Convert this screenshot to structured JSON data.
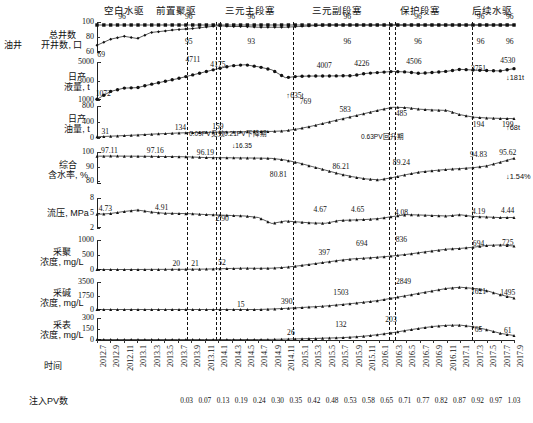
{
  "phases": [
    {
      "label": "空白水驱",
      "x": 124
    },
    {
      "label": "前置聚驱",
      "x": 176
    },
    {
      "label": "三元主段塞",
      "x": 250
    },
    {
      "label": "三元副段塞",
      "x": 337
    },
    {
      "label": "保护段塞",
      "x": 420
    },
    {
      "label": "后续水驱",
      "x": 492
    }
  ],
  "group_label": "油井",
  "rows": [
    {
      "label": "总井数\n开井数, 口",
      "unit": "口"
    },
    {
      "label": "日产\n液量, t"
    },
    {
      "label": "日产\n油量, t"
    },
    {
      "label": "综合\n含水率, %"
    },
    {
      "label": "流压, MPa"
    },
    {
      "label": "采聚\n浓度, mg/L"
    },
    {
      "label": "采碱\n浓度, mg/L"
    },
    {
      "label": "采表\n浓度, mg/L"
    }
  ],
  "axis": {
    "time_caption": "时间",
    "pv_caption": "注入PV数",
    "x_labels": [
      "2012.7",
      "2012.9",
      "2012.11",
      "2013.1",
      "2013.3",
      "2013.5",
      "2013.7",
      "2013.9",
      "2013.11",
      "2014.1",
      "2014.3",
      "2014.5",
      "2014.7",
      "2014.9",
      "2014.11",
      "2015.1",
      "2015.3",
      "2015.5",
      "2015.7",
      "2015.9",
      "2015.11",
      "2016.1",
      "2016.3",
      "2016.5",
      "2016.7",
      "2016.9",
      "2016.11",
      "2017.1",
      "2017.3",
      "2017.5",
      "2017.7",
      "2017.9"
    ],
    "pv_values": [
      "0.03",
      "0.07",
      "0.13",
      "0.19",
      "0.24",
      "0.30",
      "0.35",
      "0.42",
      "0.48",
      "0.53",
      "0.58",
      "0.65",
      "0.71",
      "0.77",
      "0.82",
      "0.87",
      "0.92",
      "0.97",
      "1.03"
    ]
  },
  "annotations": {
    "effect_onset": "0.09PV见效",
    "decline_period": "0.21PV下降期",
    "decline_delta": "↓16.35",
    "recovery_period": "0.63PV回升期",
    "right_liquid": "↓181t",
    "right_oil": "↑68t",
    "right_water": "↓1.54%"
  },
  "chart_data": {
    "type": "line",
    "title": "",
    "xlabel": "时间",
    "ylabel": "",
    "grid": false,
    "legend": "none",
    "x": [
      "2012.7",
      "2012.9",
      "2012.11",
      "2013.1",
      "2013.3",
      "2013.5",
      "2013.7",
      "2013.9",
      "2013.11",
      "2014.1",
      "2014.3",
      "2014.5",
      "2014.7",
      "2014.9",
      "2014.11",
      "2015.1",
      "2015.3",
      "2015.5",
      "2015.7",
      "2015.9",
      "2015.11",
      "2016.1",
      "2016.3",
      "2016.5",
      "2016.7",
      "2016.9",
      "2016.11",
      "2017.1",
      "2017.3",
      "2017.5",
      "2017.7",
      "2017.9"
    ],
    "panels": [
      {
        "name": "total-open-wells",
        "ylabel": "总井数 开井数, 口",
        "ylim": [
          60,
          100
        ],
        "yticks": [
          60,
          80,
          100
        ],
        "series": [
          {
            "name": "总井数",
            "marker": "square",
            "values": [
              96,
              96,
              96,
              96,
              96,
              96,
              96,
              96,
              96,
              96,
              96,
              96,
              96,
              96,
              96,
              96,
              96,
              96,
              96,
              96,
              96,
              96,
              96,
              96,
              96,
              96,
              96,
              96,
              96,
              96,
              96,
              96
            ]
          },
          {
            "name": "开井数",
            "marker": "diamond",
            "values": [
              69,
              77,
              81,
              78,
              86,
              88,
              90,
              91,
              93,
              95,
              94,
              94,
              93,
              93,
              93,
              94,
              95,
              96,
              96,
              96,
              96,
              96,
              96,
              96,
              96,
              96,
              96,
              96,
              96,
              96,
              96,
              96
            ]
          }
        ],
        "point_labels": [
          {
            "text": "96",
            "x": 0.06,
            "y": 100,
            "above": true
          },
          {
            "text": "96",
            "x": 0.22,
            "y": 100,
            "above": true
          },
          {
            "text": "96",
            "x": 0.37,
            "y": 100,
            "above": true
          },
          {
            "text": "96",
            "x": 0.6,
            "y": 100,
            "above": true
          },
          {
            "text": "96",
            "x": 0.77,
            "y": 100,
            "above": true
          },
          {
            "text": "96",
            "x": 0.92,
            "y": 100,
            "above": true
          },
          {
            "text": "96",
            "x": 0.99,
            "y": 100,
            "above": true
          },
          {
            "text": "69",
            "x": 0.01,
            "y": 67,
            "above": false
          },
          {
            "text": "95",
            "x": 0.22,
            "y": 84,
            "above": false
          },
          {
            "text": "93",
            "x": 0.37,
            "y": 84,
            "above": false
          },
          {
            "text": "96",
            "x": 0.6,
            "y": 84,
            "above": false
          },
          {
            "text": "96",
            "x": 0.77,
            "y": 84,
            "above": false
          },
          {
            "text": "96",
            "x": 0.92,
            "y": 84,
            "above": false
          },
          {
            "text": "96",
            "x": 0.99,
            "y": 84,
            "above": false
          }
        ]
      },
      {
        "name": "daily-liquid",
        "ylabel": "日产液量, t",
        "unit": "t",
        "ylim": [
          1000,
          5000
        ],
        "yticks": [
          1000,
          3000,
          5000
        ],
        "values": [
          1072,
          1900,
          2250,
          2300,
          2650,
          2950,
          3250,
          3600,
          3950,
          4300,
          4600,
          4711,
          4500,
          4175,
          3350,
          3500,
          3520,
          3530,
          3540,
          3560,
          3800,
          3900,
          4007,
          3950,
          3800,
          3900,
          4020,
          4226,
          4150,
          4100,
          4060,
          4300
        ],
        "key_labels": [
          {
            "text": "1072",
            "value": 1072,
            "x": 0.015
          },
          {
            "text": "4711",
            "value": 4711,
            "x": 0.23
          },
          {
            "text": "4175",
            "value": 4175,
            "x": 0.29
          },
          {
            "text": "4007",
            "value": 4007,
            "x": 0.545
          },
          {
            "text": "4226",
            "value": 4226,
            "x": 0.635
          },
          {
            "text": "4506",
            "value": 4506,
            "x": 0.76
          },
          {
            "text": "3751",
            "value": 3751,
            "x": 0.915
          },
          {
            "text": "4530",
            "value": 4530,
            "x": 0.985
          }
        ]
      },
      {
        "name": "daily-oil",
        "ylabel": "日产油量, t",
        "unit": "t",
        "ylim": [
          0,
          800
        ],
        "yticks": [
          0,
          400,
          800
        ],
        "values": [
          31,
          45,
          60,
          75,
          95,
          110,
          125,
          134,
          140,
          145,
          150,
          155,
          159,
          165,
          180,
          230,
          300,
          380,
          460,
          540,
          620,
          700,
          769,
          760,
          720,
          700,
          690,
          583,
          520,
          500,
          490,
          485
        ],
        "key_labels": [
          {
            "text": "31",
            "value": 31,
            "x": 0.02
          },
          {
            "text": "134",
            "value": 134,
            "x": 0.2
          },
          {
            "text": "159",
            "value": 159,
            "x": 0.29
          },
          {
            "text": "769",
            "value": 769,
            "x": 0.5
          },
          {
            "text": "583",
            "value": 583,
            "x": 0.595
          },
          {
            "text": "485",
            "value": 485,
            "x": 0.73
          },
          {
            "text": "194",
            "value": 194,
            "x": 0.915
          },
          {
            "text": "199",
            "value": 199,
            "x": 0.985
          }
        ]
      },
      {
        "name": "water-cut",
        "ylabel": "综合含水率, %",
        "unit": "%",
        "ylim": [
          78,
          100
        ],
        "yticks": [
          80,
          90,
          100
        ],
        "values": [
          97.11,
          97.2,
          97.16,
          97.1,
          97.0,
          96.9,
          96.8,
          96.6,
          96.19,
          96.1,
          96.0,
          95.9,
          95.8,
          95.6,
          94.5,
          92.5,
          90.0,
          87.5,
          85.0,
          83.0,
          81.5,
          80.81,
          82.5,
          84.5,
          86.21,
          87.2,
          88.0,
          88.6,
          89.24,
          90.5,
          93.0,
          95.62
        ],
        "key_labels": [
          {
            "text": "97.11",
            "value": 97.11,
            "x": 0.03
          },
          {
            "text": "97.16",
            "value": 97.16,
            "x": 0.14
          },
          {
            "text": "96.19",
            "value": 96.19,
            "x": 0.26
          },
          {
            "text": "80.81",
            "value": 80.81,
            "x": 0.435
          },
          {
            "text": "86.21",
            "value": 86.21,
            "x": 0.585
          },
          {
            "text": "89.24",
            "value": 89.24,
            "x": 0.73
          },
          {
            "text": "94.83",
            "value": 94.83,
            "x": 0.915
          },
          {
            "text": "95.62",
            "value": 95.62,
            "x": 0.985
          }
        ]
      },
      {
        "name": "flowing-pressure",
        "ylabel": "流压, MPa",
        "unit": "MPa",
        "ylim": [
          2,
          8
        ],
        "yticks": [
          2,
          5,
          8
        ],
        "values": [
          4.73,
          4.9,
          5.3,
          5.6,
          5.2,
          4.95,
          4.91,
          4.85,
          4.7,
          4.6,
          4.5,
          4.4,
          4.1,
          2.9,
          3.4,
          3.2,
          3.0,
          2.95,
          3.5,
          3.6,
          3.7,
          3.9,
          4.3,
          4.67,
          4.6,
          4.5,
          4.4,
          4.65,
          4.3,
          4.2,
          4.08,
          4.1
        ],
        "key_labels": [
          {
            "text": "4.73",
            "value": 4.73,
            "x": 0.02
          },
          {
            "text": "4.91",
            "value": 4.91,
            "x": 0.155
          },
          {
            "text": "2.90",
            "value": 2.9,
            "x": 0.3
          },
          {
            "text": "4.67",
            "value": 4.67,
            "x": 0.535
          },
          {
            "text": "4.65",
            "value": 4.65,
            "x": 0.625
          },
          {
            "text": "4.08",
            "value": 4.08,
            "x": 0.73
          },
          {
            "text": "4.19",
            "value": 4.19,
            "x": 0.915
          },
          {
            "text": "4.44",
            "value": 4.44,
            "x": 0.985
          }
        ]
      },
      {
        "name": "produced-polymer",
        "ylabel": "采聚浓度, mg/L",
        "unit": "mg/L",
        "ylim": [
          0,
          1000
        ],
        "yticks": [
          0,
          500,
          1000
        ],
        "values": [
          0,
          5,
          10,
          15,
          20,
          21,
          22,
          25,
          30,
          40,
          52,
          60,
          55,
          60,
          90,
          140,
          200,
          260,
          320,
          370,
          397,
          430,
          470,
          520,
          580,
          640,
          694,
          720,
          760,
          820,
          836,
          800
        ],
        "key_labels": [
          {
            "text": "20",
            "value": 20,
            "x": 0.19
          },
          {
            "text": "21",
            "value": 21,
            "x": 0.235
          },
          {
            "text": "52",
            "value": 52,
            "x": 0.3
          },
          {
            "text": "397",
            "value": 397,
            "x": 0.545
          },
          {
            "text": "694",
            "value": 694,
            "x": 0.635
          },
          {
            "text": "836",
            "value": 836,
            "x": 0.73
          },
          {
            "text": "694",
            "value": 694,
            "x": 0.915
          },
          {
            "text": "725",
            "value": 725,
            "x": 0.985
          }
        ]
      },
      {
        "name": "produced-alkali",
        "ylabel": "采碱浓度, mg/L",
        "unit": "mg/L",
        "ylim": [
          0,
          3500
        ],
        "yticks": [
          0,
          1750,
          3500
        ],
        "values": [
          0,
          0,
          0,
          0,
          0,
          0,
          0,
          0,
          0,
          0,
          0,
          15,
          60,
          120,
          200,
          290,
          390,
          500,
          650,
          820,
          1000,
          1200,
          1503,
          1800,
          2100,
          2400,
          2700,
          2849,
          2700,
          2400,
          1900,
          1495
        ],
        "key_labels": [
          {
            "text": "15",
            "value": 15,
            "x": 0.345
          },
          {
            "text": "390",
            "value": 390,
            "x": 0.455
          },
          {
            "text": "1503",
            "value": 1503,
            "x": 0.585
          },
          {
            "text": "2849",
            "value": 2849,
            "x": 0.735
          },
          {
            "text": "1621",
            "value": 1621,
            "x": 0.915
          },
          {
            "text": "1495",
            "value": 1495,
            "x": 0.985
          }
        ]
      },
      {
        "name": "produced-surfactant",
        "ylabel": "采表浓度, mg/L",
        "unit": "mg/L",
        "ylim": [
          0,
          300
        ],
        "yticks": [
          0,
          150,
          300
        ],
        "values": [
          0,
          0,
          0,
          0,
          0,
          0,
          0,
          0,
          0,
          0,
          0,
          0,
          0,
          8,
          12,
          16,
          20,
          26,
          30,
          40,
          55,
          75,
          100,
          132,
          160,
          185,
          200,
          203,
          180,
          140,
          90,
          61
        ],
        "key_labels": [
          {
            "text": "26",
            "value": 26,
            "x": 0.465
          },
          {
            "text": "132",
            "value": 132,
            "x": 0.585
          },
          {
            "text": "203",
            "value": 203,
            "x": 0.705
          },
          {
            "text": "65",
            "value": 65,
            "x": 0.915
          },
          {
            "text": "61",
            "value": 61,
            "x": 0.985
          }
        ]
      }
    ],
    "phase_boundaries": [
      0.215,
      0.285,
      0.295,
      0.47,
      0.7,
      0.715,
      0.9
    ]
  }
}
